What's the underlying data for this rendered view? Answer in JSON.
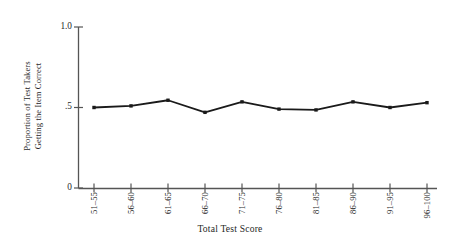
{
  "chart_data": {
    "type": "line",
    "title": "",
    "xlabel": "Total Test Score",
    "ylabel": "Proportion of Test Takers Getting the Item Correct",
    "ylabel_line1": "Proportion of Test Takers",
    "ylabel_line2": "Getting the Item Correct",
    "categories": [
      "51–55",
      "56–60",
      "61–65",
      "66–70",
      "71–75",
      "76–80",
      "81–85",
      "86–90",
      "91–95",
      "96–100"
    ],
    "values": [
      0.5,
      0.51,
      0.545,
      0.47,
      0.535,
      0.49,
      0.485,
      0.535,
      0.5,
      0.53
    ],
    "ylim": [
      0,
      1.0
    ],
    "ytick_values": [
      0,
      0.5,
      1.0
    ],
    "ytick_labels": [
      "0",
      ".5",
      "1.0"
    ],
    "grid": false,
    "legend": null,
    "series_color": "#1a1a1a",
    "marker": "square",
    "axis_color": "#555555"
  }
}
